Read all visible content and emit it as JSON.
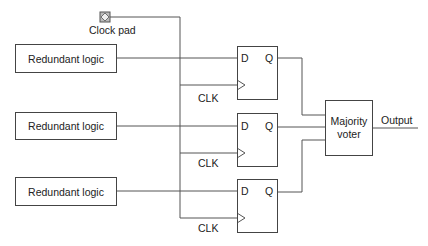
{
  "diagram": {
    "clock_pad": {
      "label": "Clock pad",
      "icon": "clock-pad-icon"
    },
    "logic_blocks": [
      {
        "label": "Redundant logic"
      },
      {
        "label": "Redundant logic"
      },
      {
        "label": "Redundant logic"
      }
    ],
    "flip_flops": [
      {
        "d_label": "D",
        "q_label": "Q",
        "clk_label": "CLK"
      },
      {
        "d_label": "D",
        "q_label": "Q",
        "clk_label": "CLK"
      },
      {
        "d_label": "D",
        "q_label": "Q",
        "clk_label": "CLK"
      }
    ],
    "voter": {
      "line1": "Majority",
      "line2": "voter"
    },
    "output_label": "Output",
    "colors": {
      "line": "#555555",
      "box_border": "#444444",
      "pad_fill": "#bbbbbb"
    }
  }
}
